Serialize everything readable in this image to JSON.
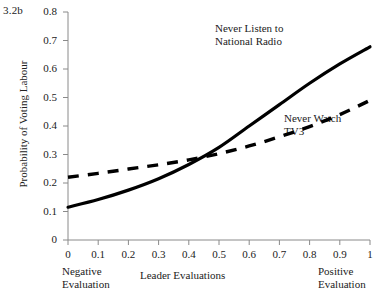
{
  "figure": {
    "label": "3.2b"
  },
  "chart_data": {
    "type": "line",
    "title": "3.2b",
    "xlabel": "Leader Evaluations",
    "ylabel": "Probability of Voting Labour",
    "xlim": [
      0,
      1
    ],
    "ylim": [
      0,
      0.8
    ],
    "grid": false,
    "legend_position": "inline-annotations",
    "xticks": [
      "0",
      "0.1",
      "0.2",
      "0.3",
      "0.4",
      "0.5",
      "0.6",
      "0.7",
      "0.8",
      "0.9",
      "1"
    ],
    "xtick_values": [
      0,
      0.1,
      0.2,
      0.3,
      0.4,
      0.5,
      0.6,
      0.7,
      0.8,
      0.9,
      1
    ],
    "yticks": [
      "0",
      "0.1",
      "0.2",
      "0.3",
      "0.4",
      "0.5",
      "0.6",
      "0.7",
      "0.8"
    ],
    "ytick_values": [
      0,
      0.1,
      0.2,
      0.3,
      0.4,
      0.5,
      0.6,
      0.7,
      0.8
    ],
    "x_axis_end_labels": {
      "left_line1": "Negative",
      "left_line2": "Evaluation",
      "right_line1": "Positive",
      "right_line2": "Evaluation"
    },
    "x": [
      0,
      0.1,
      0.2,
      0.3,
      0.4,
      0.5,
      0.6,
      0.7,
      0.8,
      0.9,
      1
    ],
    "series": [
      {
        "name": "Never Listen to National Radio",
        "label_text": "Never Listen to\nNational Radio",
        "style": "solid",
        "color": "#000000",
        "width": 3.2,
        "values": [
          0.115,
          0.142,
          0.175,
          0.215,
          0.265,
          0.325,
          0.4,
          0.475,
          0.55,
          0.618,
          0.678
        ]
      },
      {
        "name": "Never Watch TV3",
        "label_text": "Never Watch\nTV3",
        "style": "dashed",
        "color": "#000000",
        "width": 3.4,
        "values": [
          0.22,
          0.234,
          0.249,
          0.264,
          0.281,
          0.303,
          0.33,
          0.362,
          0.398,
          0.44,
          0.49
        ]
      }
    ],
    "annotations": [
      {
        "text": "Never Listen to National Radio",
        "x": 0.72,
        "y": 0.72
      },
      {
        "text": "Never Watch TV3",
        "x": 0.87,
        "y": 0.33
      }
    ]
  },
  "axis_labels": {
    "y_title": "Probability of Voting Labour",
    "x_title": "Leader Evaluations"
  },
  "colors": {
    "line": "#000000",
    "axis": "#8a8a8a",
    "text": "#222222"
  }
}
